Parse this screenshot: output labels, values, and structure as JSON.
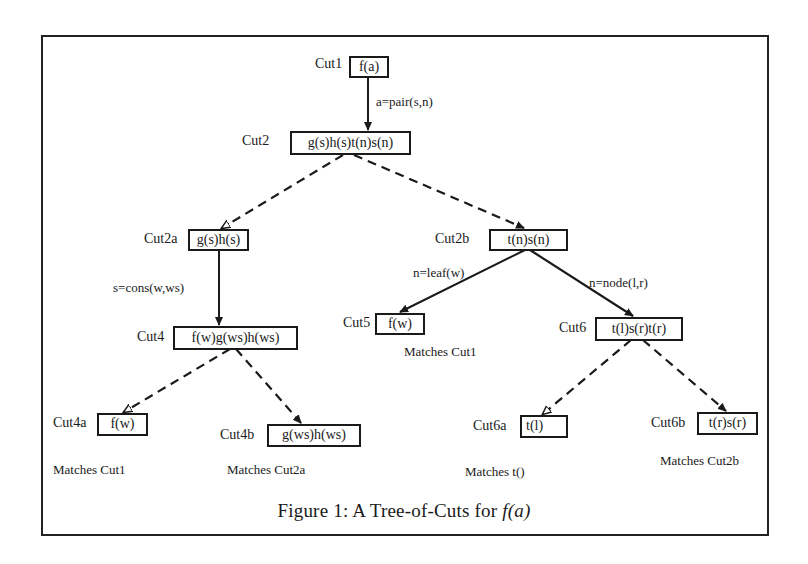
{
  "figure": {
    "caption_prefix": "Figure 1: A Tree-of-Cuts for ",
    "caption_math": "f(a)"
  },
  "nodes": {
    "cut1": {
      "label": "Cut1",
      "expr": "f(a)"
    },
    "cut2": {
      "label": "Cut2",
      "expr": "g(s)h(s)t(n)s(n)"
    },
    "cut2a": {
      "label": "Cut2a",
      "expr": "g(s)h(s)"
    },
    "cut2b": {
      "label": "Cut2b",
      "expr": "t(n)s(n)"
    },
    "cut4": {
      "label": "Cut4",
      "expr": "f(w)g(ws)h(ws)"
    },
    "cut5": {
      "label": "Cut5",
      "expr": "f(w)",
      "match": "Matches Cut1"
    },
    "cut6": {
      "label": "Cut6",
      "expr": "t(l)s(r)t(r)"
    },
    "cut4a": {
      "label": "Cut4a",
      "expr": "f(w)",
      "match": "Matches Cut1"
    },
    "cut4b": {
      "label": "Cut4b",
      "expr": "g(ws)h(ws)",
      "match": "Matches Cut2a"
    },
    "cut6a": {
      "label": "Cut6a",
      "expr": "t(l)",
      "match": "Matches t()"
    },
    "cut6b": {
      "label": "Cut6b",
      "expr": "t(r)s(r)",
      "match": "Matches Cut2b"
    }
  },
  "edges": {
    "cut1_cut2": {
      "label": "a=pair(s,n)",
      "style": "solid"
    },
    "cut2_cut2a": {
      "label": "",
      "style": "dashed"
    },
    "cut2_cut2b": {
      "label": "",
      "style": "dashed"
    },
    "cut2a_cut4": {
      "label": "s=cons(w,ws)",
      "style": "solid"
    },
    "cut2b_cut5": {
      "label": "n=leaf(w)",
      "style": "solid"
    },
    "cut2b_cut6": {
      "label": "n=node(l,r)",
      "style": "solid"
    },
    "cut4_cut4a": {
      "label": "",
      "style": "dashed"
    },
    "cut4_cut4b": {
      "label": "",
      "style": "dashed"
    },
    "cut6_cut6a": {
      "label": "",
      "style": "dashed"
    },
    "cut6_cut6b": {
      "label": "",
      "style": "dashed"
    }
  }
}
